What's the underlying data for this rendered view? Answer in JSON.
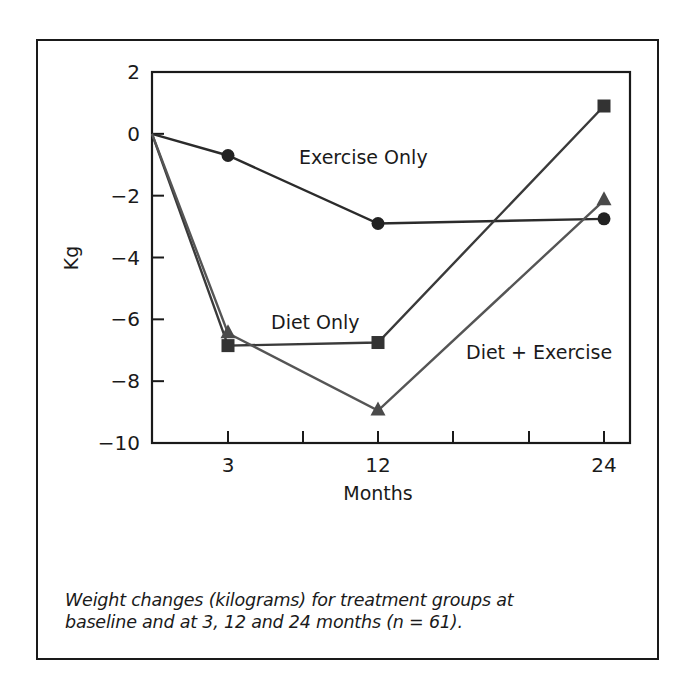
{
  "chart_data": {
    "type": "line",
    "title": "",
    "xlabel": "Months",
    "ylabel": "Kg",
    "x": [
      0,
      3,
      12,
      24
    ],
    "x_tick_labels": [
      "3",
      "12",
      "24"
    ],
    "y_ticks": [
      2,
      0,
      -2,
      -4,
      -6,
      -8,
      -10
    ],
    "y_tick_labels": [
      "2",
      "0",
      "−2",
      "−4",
      "−6",
      "−8",
      "−10"
    ],
    "ylim": [
      -10,
      2
    ],
    "grid": false,
    "legend": "inline labels",
    "series": [
      {
        "name": "Exercise Only",
        "marker": "circle",
        "color": "#2b2b2b",
        "values": [
          0,
          -0.7,
          -2.9,
          -2.75
        ]
      },
      {
        "name": "Diet Only",
        "marker": "square",
        "color": "#3a3a3a",
        "values": [
          0,
          -6.85,
          -6.75,
          0.9
        ]
      },
      {
        "name": "Diet + Exercise",
        "marker": "triangle",
        "color": "#555555",
        "values": [
          0,
          -6.45,
          -8.95,
          -2.15
        ]
      }
    ]
  },
  "caption": {
    "line1": "Weight changes (kilograms) for treatment groups at",
    "line2": "baseline and at 3, 12 and 24 months (n = 61)."
  }
}
